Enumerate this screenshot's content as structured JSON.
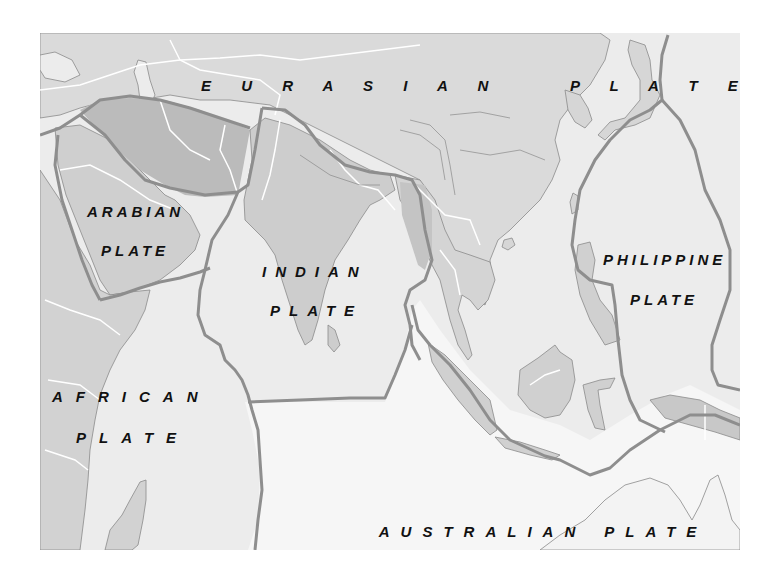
{
  "map": {
    "title": "Tectonic plates of Asia and the Indian Ocean",
    "colors": {
      "page_background": "#ffffff",
      "ocean": "#eeeeee",
      "land": "#dadada",
      "land_dark": "#c4c4c4",
      "iran_block": "#b9b9b9",
      "plate_fill": "#e2e2e2",
      "australian_ocean": "#f7f7f7",
      "plate_boundary": "#8e8e8e",
      "country_border": "#ffffff",
      "coastline": "#8a8a8a",
      "label_text": "#111111"
    },
    "plates": [
      {
        "id": "eurasian",
        "name": "EURASIAN PLATE",
        "lines": [
          "E U R A S I A N    P L A T E"
        ]
      },
      {
        "id": "arabian",
        "name": "ARABIAN PLATE",
        "lines": [
          "ARABIAN",
          "PLATE"
        ]
      },
      {
        "id": "indian",
        "name": "INDIAN PLATE",
        "lines": [
          "INDIAN",
          "PLATE"
        ]
      },
      {
        "id": "philippine",
        "name": "PHILIPPINE PLATE",
        "lines": [
          "PHILIPPINE",
          "PLATE"
        ]
      },
      {
        "id": "african",
        "name": "AFRICAN PLATE",
        "lines": [
          "AFRICAN",
          "PLATE"
        ]
      },
      {
        "id": "australian",
        "name": "AUSTRALIAN PLATE",
        "lines": [
          "AUSTRALIAN",
          "PLATE"
        ]
      }
    ]
  }
}
